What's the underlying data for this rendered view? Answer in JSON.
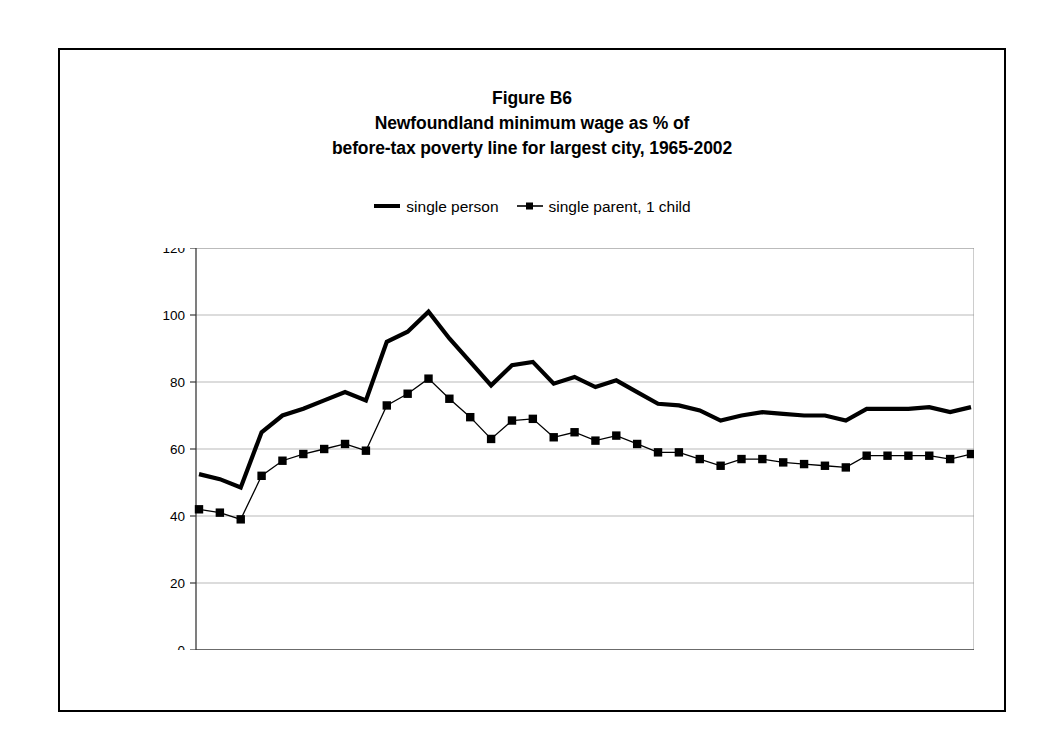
{
  "figure": {
    "title_lines": [
      "Figure B6",
      "Newfoundland minimum wage as % of",
      "before-tax poverty line for largest city, 1965-2002"
    ],
    "border_color": "#000000"
  },
  "legend": {
    "position": "top-center",
    "entries": [
      {
        "label": "single person",
        "marker": "none",
        "color": "#000000"
      },
      {
        "label": "single parent, 1 child",
        "marker": "square",
        "color": "#000000"
      }
    ]
  },
  "chart_data": {
    "type": "line",
    "xlabel": "",
    "ylabel": "",
    "xlim": [
      1965,
      2002
    ],
    "ylim": [
      0,
      120
    ],
    "ytick_step": 20,
    "yticks": [
      0,
      20,
      40,
      60,
      80,
      100,
      120
    ],
    "ytick_labels": [
      "0",
      "20",
      "40",
      "60",
      "80",
      "100",
      "120"
    ],
    "grid": true,
    "grid_axis": "y",
    "x": [
      1965,
      1966,
      1967,
      1968,
      1969,
      1970,
      1971,
      1972,
      1973,
      1974,
      1975,
      1976,
      1977,
      1978,
      1979,
      1980,
      1981,
      1982,
      1983,
      1984,
      1985,
      1986,
      1987,
      1988,
      1989,
      1990,
      1991,
      1992,
      1993,
      1994,
      1995,
      1996,
      1997,
      1998,
      1999,
      2000,
      2001,
      2002
    ],
    "xtick_labels": [
      "1965",
      "",
      "",
      "",
      "",
      "70",
      "",
      "",
      "",
      "",
      "75",
      "",
      "",
      "",
      "",
      "80",
      "",
      "",
      "",
      "",
      "85",
      "",
      "",
      "",
      "",
      "90",
      "",
      "",
      "",
      "",
      "95",
      "",
      "",
      "",
      "",
      "2000",
      "",
      "02"
    ],
    "series": [
      {
        "name": "single person",
        "marker": "none",
        "color": "#000000",
        "values": [
          52.5,
          51.0,
          48.5,
          65.0,
          70.0,
          72.0,
          74.5,
          77.0,
          74.5,
          92.0,
          95.0,
          101.0,
          93.0,
          86.0,
          79.0,
          85.0,
          86.0,
          79.5,
          81.5,
          78.5,
          80.5,
          77.0,
          73.5,
          73.0,
          71.5,
          68.5,
          70.0,
          71.0,
          70.5,
          70.0,
          70.0,
          68.5,
          72.0,
          72.0,
          72.0,
          72.5,
          71.0,
          72.5
        ]
      },
      {
        "name": "single parent, 1 child",
        "marker": "square",
        "color": "#000000",
        "values": [
          42.0,
          41.0,
          39.0,
          52.0,
          56.5,
          58.5,
          60.0,
          61.5,
          59.5,
          73.0,
          76.5,
          81.0,
          75.0,
          69.5,
          63.0,
          68.5,
          69.0,
          63.5,
          65.0,
          62.5,
          64.0,
          61.5,
          59.0,
          59.0,
          57.0,
          55.0,
          57.0,
          57.0,
          56.0,
          55.5,
          55.0,
          54.5,
          58.0,
          58.0,
          58.0,
          58.0,
          57.0,
          58.5
        ]
      }
    ]
  }
}
